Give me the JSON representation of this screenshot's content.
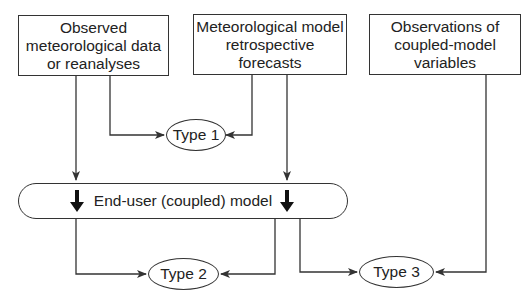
{
  "diagram": {
    "inputs": [
      {
        "id": "observed",
        "label": "Observed meteorological data or reanalyses"
      },
      {
        "id": "forecasts",
        "label": "Meteorological model retrospective forecasts"
      },
      {
        "id": "observations",
        "label": "Observations of coupled-model variables"
      }
    ],
    "model": {
      "label": "End-user (coupled) model"
    },
    "outputs": [
      {
        "id": "type1",
        "label": "Type 1"
      },
      {
        "id": "type2",
        "label": "Type 2"
      },
      {
        "id": "type3",
        "label": "Type 3"
      }
    ],
    "edges": [
      {
        "from": "observed",
        "to": "type1"
      },
      {
        "from": "forecasts",
        "to": "type1"
      },
      {
        "from": "observed",
        "to": "model"
      },
      {
        "from": "forecasts",
        "to": "model"
      },
      {
        "from": "model",
        "to": "type2"
      },
      {
        "from": "model",
        "to": "type2"
      },
      {
        "from": "model",
        "to": "type3"
      },
      {
        "from": "observations",
        "to": "type3"
      }
    ],
    "colors": {
      "line": "#333333",
      "background": "#ffffff"
    }
  }
}
